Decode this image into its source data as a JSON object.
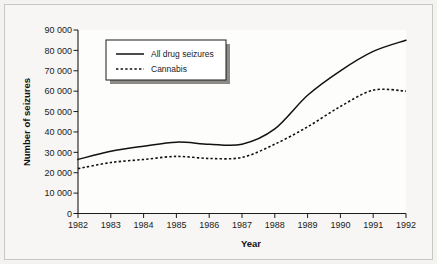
{
  "chart_data": {
    "type": "line",
    "title": "",
    "xlabel": "Year",
    "ylabel": "Number of seizures",
    "x": [
      1982,
      1983,
      1984,
      1985,
      1986,
      1987,
      1988,
      1989,
      1990,
      1991,
      1992
    ],
    "categories": [
      "1982",
      "1983",
      "1984",
      "1985",
      "1986",
      "1987",
      "1988",
      "1989",
      "1990",
      "1991",
      "1992"
    ],
    "xlim": [
      1982,
      1992
    ],
    "ylim": [
      0,
      90000
    ],
    "grid": false,
    "legend_position": "upper-left-inside",
    "yticks": [
      0,
      10000,
      20000,
      30000,
      40000,
      50000,
      60000,
      70000,
      80000,
      90000
    ],
    "ytick_labels": [
      "0",
      "10 000",
      "20 000",
      "30 000",
      "40 000",
      "50 000",
      "60 000",
      "70 000",
      "80 000",
      "90 000"
    ],
    "xtick_labels": [
      "1982",
      "1983",
      "1984",
      "1985",
      "1986",
      "1987",
      "1988",
      "1989",
      "1990",
      "1991",
      "1992"
    ],
    "series": [
      {
        "name": "All drug seizures",
        "style": "solid",
        "color": "#111111",
        "values": [
          26500,
          30500,
          33000,
          35000,
          34000,
          34000,
          41500,
          58000,
          70000,
          79500,
          85000
        ]
      },
      {
        "name": "Cannabis",
        "style": "dotted",
        "color": "#111111",
        "values": [
          22000,
          25000,
          26500,
          28000,
          27000,
          27500,
          34000,
          42500,
          52500,
          60500,
          60000
        ]
      }
    ]
  },
  "legend": {
    "entries": [
      {
        "label": "All drug seizures",
        "style": "solid"
      },
      {
        "label": "Cannabis",
        "style": "dotted"
      }
    ]
  },
  "axes": {
    "y_title": "Number of seizures",
    "x_title": "Year"
  }
}
